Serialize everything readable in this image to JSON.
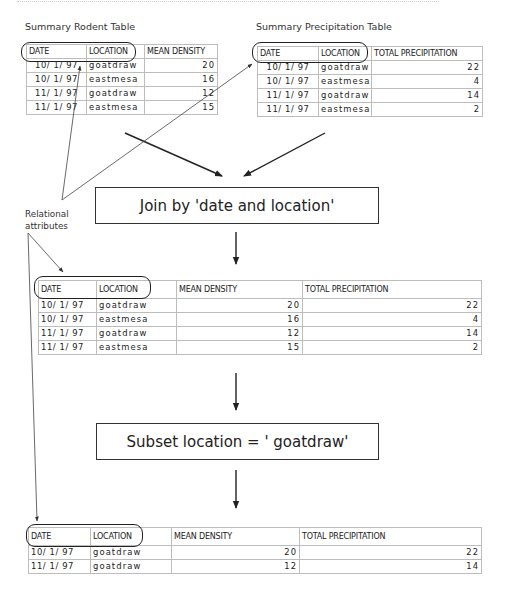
{
  "rodent_table": {
    "caption": "Summary Rodent Table",
    "headers": [
      "DATE",
      "LOCATION",
      "MEAN DENSITY"
    ],
    "rows": [
      [
        "10/ 1/ 97",
        "goatdraw",
        "20"
      ],
      [
        "10/ 1/ 97",
        "eastmesa",
        "16"
      ],
      [
        "11/ 1/ 97",
        "goatdraw",
        "12"
      ],
      [
        "11/ 1/ 97",
        "eastmesa",
        "15"
      ]
    ]
  },
  "precip_table": {
    "caption": "Summary Precipitation Table",
    "headers": [
      "DATE",
      "LOCATION",
      "TOTAL PRECIPITATION"
    ],
    "rows": [
      [
        "10/ 1/ 97",
        "goatdraw",
        "22"
      ],
      [
        "10/ 1/ 97",
        "eastmesa",
        "4"
      ],
      [
        "11/ 1/ 97",
        "goatdraw",
        "14"
      ],
      [
        "11/ 1/ 97",
        "eastmesa",
        "2"
      ]
    ]
  },
  "join_step": {
    "label": "Join by 'date and location'"
  },
  "annotation": {
    "line1": "Relational",
    "line2": "attributes"
  },
  "joined_table": {
    "headers": [
      "DATE",
      "LOCATION",
      "MEAN DENSITY",
      "TOTAL PRECIPITATION"
    ],
    "rows": [
      [
        "10/ 1/ 97",
        "goatdraw",
        "20",
        "22"
      ],
      [
        "10/ 1/ 97",
        "eastmesa",
        "16",
        "4"
      ],
      [
        "11/ 1/ 97",
        "goatdraw",
        "12",
        "14"
      ],
      [
        "11/ 1/ 97",
        "eastmesa",
        "15",
        "2"
      ]
    ]
  },
  "subset_step": {
    "label": "Subset location = ' goatdraw'"
  },
  "result_table": {
    "headers": [
      "DATE",
      "LOCATION",
      "MEAN DENSITY",
      "TOTAL PRECIPITATION"
    ],
    "rows": [
      [
        "10/ 1/ 97",
        "goatdraw",
        "20",
        "22"
      ],
      [
        "11/ 1/ 97",
        "goatdraw",
        "12",
        "14"
      ]
    ]
  },
  "colors": {
    "line": "#222222",
    "grid": "#bdbdbd",
    "text": "#222222"
  }
}
